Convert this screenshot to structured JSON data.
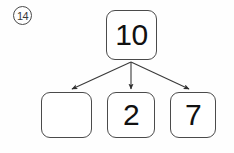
{
  "problem": {
    "number_label": "14"
  },
  "diagram": {
    "type": "number-bond-tree",
    "whole": {
      "label": "10",
      "box": {
        "x": 106,
        "y": 10,
        "w": 51,
        "h": 50
      }
    },
    "parts": [
      {
        "label": "",
        "empty": true,
        "box": {
          "x": 41,
          "y": 92,
          "w": 51,
          "h": 46
        }
      },
      {
        "label": "2",
        "empty": false,
        "box": {
          "x": 107,
          "y": 92,
          "w": 48,
          "h": 46
        }
      },
      {
        "label": "7",
        "empty": false,
        "box": {
          "x": 170,
          "y": 92,
          "w": 46,
          "h": 46
        }
      }
    ],
    "arrows": [
      {
        "name": "arrow-to-part-1",
        "from": [
          131,
          62
        ],
        "to": [
          70,
          90
        ]
      },
      {
        "name": "arrow-to-part-2",
        "from": [
          131,
          62
        ],
        "to": [
          131,
          90
        ]
      },
      {
        "name": "arrow-to-part-3",
        "from": [
          131,
          62
        ],
        "to": [
          191,
          90
        ]
      }
    ],
    "colors": {
      "stroke": "#4b4b4b",
      "arrow": "#3a3a3a",
      "text": "#111111",
      "background": "#fefefe"
    }
  }
}
